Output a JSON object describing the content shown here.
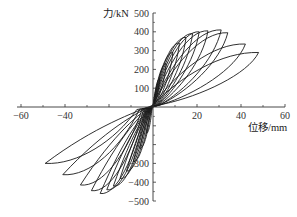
{
  "chart_data": {
    "type": "line",
    "title": "",
    "xlabel": "位移/mm",
    "ylabel": "力/kN",
    "xlim": [
      -60,
      60
    ],
    "ylim": [
      -500,
      500
    ],
    "x_ticks": [
      -60,
      -40,
      -20,
      20,
      40,
      60
    ],
    "x_tick_labels": [
      "−60",
      "−40",
      "",
      "20",
      "40",
      "60"
    ],
    "y_ticks": [
      500,
      400,
      300,
      200,
      100,
      -100,
      -200,
      -300,
      -400,
      -500
    ],
    "y_tick_labels": [
      "500",
      "400",
      "300",
      "200",
      "100",
      "",
      "",
      "−300",
      "−400",
      "−500"
    ],
    "grid": false,
    "legend": null,
    "series": [
      {
        "name": "cycle-1",
        "peak_pos": [
          3,
          150
        ],
        "peak_neg": [
          -3,
          -140
        ],
        "width": 8
      },
      {
        "name": "cycle-2",
        "peak_pos": [
          6,
          230
        ],
        "peak_neg": [
          -6,
          -220
        ],
        "width": 12
      },
      {
        "name": "cycle-3",
        "peak_pos": [
          9,
          290
        ],
        "peak_neg": [
          -9,
          -290
        ],
        "width": 16
      },
      {
        "name": "cycle-4",
        "peak_pos": [
          12,
          340
        ],
        "peak_neg": [
          -12,
          -340
        ],
        "width": 20
      },
      {
        "name": "cycle-5",
        "peak_pos": [
          15,
          370
        ],
        "peak_neg": [
          -15,
          -380
        ],
        "width": 24
      },
      {
        "name": "cycle-6",
        "peak_pos": [
          18,
          390
        ],
        "peak_neg": [
          -18,
          -420
        ],
        "width": 28
      },
      {
        "name": "cycle-7",
        "peak_pos": [
          21,
          400
        ],
        "peak_neg": [
          -21,
          -440
        ],
        "width": 32
      },
      {
        "name": "cycle-8",
        "peak_pos": [
          25,
          405
        ],
        "peak_neg": [
          -24,
          -460
        ],
        "width": 36
      },
      {
        "name": "cycle-9",
        "peak_pos": [
          31,
          410
        ],
        "peak_neg": [
          -28,
          -445
        ],
        "width": 42
      },
      {
        "name": "cycle-10",
        "peak_pos": [
          34,
          395
        ],
        "peak_neg": [
          -33,
          -415
        ],
        "width": 50
      },
      {
        "name": "cycle-11",
        "peak_pos": [
          42,
          335
        ],
        "peak_neg": [
          -41,
          -360
        ],
        "width": 62
      },
      {
        "name": "cycle-12",
        "peak_pos": [
          48,
          290
        ],
        "peak_neg": [
          -49,
          -300
        ],
        "width": 72
      }
    ],
    "line_color": "#1a1a1a"
  }
}
